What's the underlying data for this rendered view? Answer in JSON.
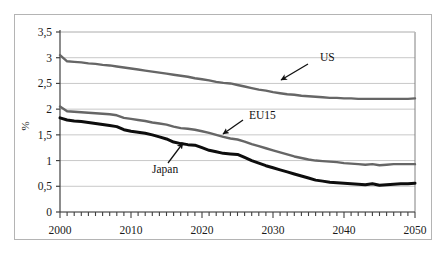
{
  "chart_data": {
    "type": "line",
    "title": "",
    "xlabel": "",
    "ylabel": "%",
    "xlim": [
      2000,
      2050
    ],
    "ylim": [
      0,
      3.5
    ],
    "grid": true,
    "legend_position": "inline-annotations",
    "y_ticks": [
      0,
      0.5,
      1,
      1.5,
      2,
      2.5,
      3,
      3.5
    ],
    "y_tick_labels": [
      "0",
      "0,5",
      "1",
      "1,5",
      "2",
      "2,5",
      "3",
      "3,5"
    ],
    "x_ticks": [
      2000,
      2010,
      2020,
      2030,
      2040,
      2050
    ],
    "x_tick_labels": [
      "2000",
      "2010",
      "2020",
      "2030",
      "2040",
      "2050"
    ],
    "x_minor_tick_interval": 1,
    "x": [
      2000,
      2001,
      2002,
      2003,
      2004,
      2005,
      2006,
      2007,
      2008,
      2009,
      2010,
      2011,
      2012,
      2013,
      2014,
      2015,
      2016,
      2017,
      2018,
      2019,
      2020,
      2021,
      2022,
      2023,
      2024,
      2025,
      2026,
      2027,
      2028,
      2029,
      2030,
      2031,
      2032,
      2033,
      2034,
      2035,
      2036,
      2037,
      2038,
      2039,
      2040,
      2041,
      2042,
      2043,
      2044,
      2045,
      2046,
      2047,
      2048,
      2049,
      2050
    ],
    "series": [
      {
        "name": "US",
        "color": "#666666",
        "line_width": 2.4,
        "values": [
          3.05,
          2.93,
          2.92,
          2.91,
          2.89,
          2.88,
          2.86,
          2.85,
          2.83,
          2.81,
          2.79,
          2.77,
          2.75,
          2.73,
          2.71,
          2.69,
          2.67,
          2.65,
          2.63,
          2.6,
          2.58,
          2.56,
          2.53,
          2.51,
          2.5,
          2.47,
          2.44,
          2.41,
          2.38,
          2.36,
          2.33,
          2.31,
          2.29,
          2.28,
          2.26,
          2.25,
          2.24,
          2.23,
          2.22,
          2.22,
          2.21,
          2.21,
          2.2,
          2.2,
          2.2,
          2.2,
          2.2,
          2.2,
          2.2,
          2.2,
          2.21
        ]
      },
      {
        "name": "EU15",
        "color": "#666666",
        "line_width": 2.4,
        "values": [
          2.05,
          1.96,
          1.95,
          1.94,
          1.93,
          1.92,
          1.91,
          1.9,
          1.88,
          1.83,
          1.81,
          1.79,
          1.77,
          1.74,
          1.72,
          1.7,
          1.66,
          1.63,
          1.62,
          1.6,
          1.57,
          1.54,
          1.5,
          1.46,
          1.43,
          1.41,
          1.37,
          1.32,
          1.28,
          1.24,
          1.2,
          1.16,
          1.12,
          1.08,
          1.05,
          1.02,
          1.0,
          0.99,
          0.98,
          0.97,
          0.95,
          0.94,
          0.93,
          0.92,
          0.93,
          0.91,
          0.92,
          0.93,
          0.93,
          0.93,
          0.93
        ]
      },
      {
        "name": "Japan",
        "color": "#0d0d0d",
        "line_width": 3.0,
        "values": [
          1.83,
          1.79,
          1.77,
          1.76,
          1.74,
          1.72,
          1.7,
          1.68,
          1.66,
          1.6,
          1.57,
          1.55,
          1.53,
          1.5,
          1.46,
          1.42,
          1.36,
          1.33,
          1.31,
          1.3,
          1.25,
          1.2,
          1.17,
          1.14,
          1.13,
          1.12,
          1.06,
          1.0,
          0.95,
          0.9,
          0.86,
          0.82,
          0.78,
          0.74,
          0.7,
          0.66,
          0.62,
          0.6,
          0.58,
          0.57,
          0.56,
          0.55,
          0.54,
          0.53,
          0.55,
          0.52,
          0.53,
          0.54,
          0.55,
          0.55,
          0.56
        ]
      }
    ],
    "annotations": [
      {
        "text": "US",
        "series": "US",
        "text_x": 320,
        "text_y": 61,
        "arrow_from_x": 308,
        "arrow_from_y": 64,
        "arrow_to_x": 281,
        "arrow_to_y": 80
      },
      {
        "text": "EU15",
        "series": "EU15",
        "text_x": 249,
        "text_y": 119,
        "arrow_from_x": 243,
        "arrow_from_y": 120,
        "arrow_to_x": 223,
        "arrow_to_y": 134
      },
      {
        "text": "Japan",
        "series": "Japan",
        "text_x": 152,
        "text_y": 173,
        "arrow_from_x": 168,
        "arrow_from_y": 163,
        "arrow_to_x": 183,
        "arrow_to_y": 143
      }
    ]
  },
  "colors": {
    "outer_frame": "#b4b4b4",
    "plot_border": "#808080",
    "gridline": "#c8c8c8",
    "axis": "#404040",
    "text": "#1a1a1a",
    "background": "#ffffff"
  }
}
